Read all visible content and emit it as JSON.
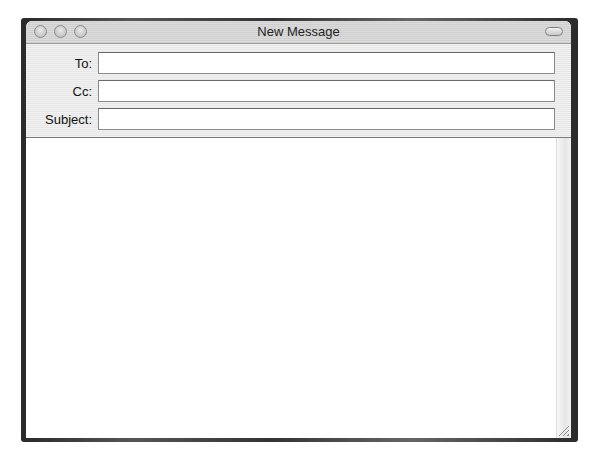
{
  "window": {
    "title": "New Message",
    "controls": [
      "close-button",
      "minimize-button",
      "zoom-button"
    ],
    "toolbar_toggle": "toolbar-toggle-button"
  },
  "fields": {
    "to": {
      "label": "To:",
      "value": ""
    },
    "cc": {
      "label": "Cc:",
      "value": ""
    },
    "subject": {
      "label": "Subject:",
      "value": ""
    }
  },
  "message_body": {
    "value": ""
  }
}
